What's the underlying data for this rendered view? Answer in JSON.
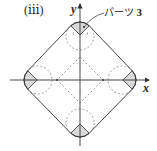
{
  "figure": {
    "panel_label": "(ⅲ)",
    "axes": {
      "x_label": "x",
      "y_label": "y"
    },
    "callout": {
      "text": "パーツ",
      "number": "3"
    },
    "small_labels": [
      "1",
      "1"
    ],
    "colors": {
      "stroke": "#333333",
      "dashed": "#777777",
      "fill": "#d9d9d9"
    },
    "shapes": {
      "outer": "rounded square rotated 45° (diamond with arc corners)",
      "inner": "dashed diamond",
      "corner_circles": 4,
      "shaded_sectors": 4
    }
  }
}
